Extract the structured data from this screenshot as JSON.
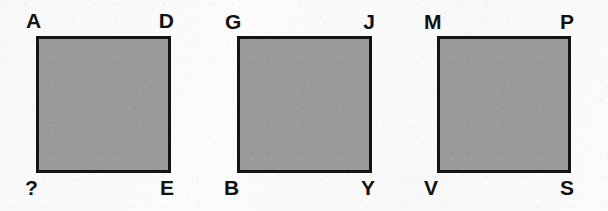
{
  "canvas": {
    "width": 608,
    "height": 211,
    "background_color": "#fbfbfb",
    "fill_color": "#9a9a9a",
    "stroke_color": "#141414",
    "label_color": "#121212"
  },
  "figures": [
    {
      "name": "square-1",
      "x": 36,
      "y": 36,
      "width": 135,
      "height": 137,
      "labels": {
        "top_left": "A",
        "top_right": "D",
        "bottom_left": "?",
        "bottom_right": "E"
      }
    },
    {
      "name": "square-2",
      "x": 237,
      "y": 36,
      "width": 135,
      "height": 137,
      "labels": {
        "top_left": "G",
        "top_right": "J",
        "bottom_left": "B",
        "bottom_right": "Y"
      }
    },
    {
      "name": "square-3",
      "x": 437,
      "y": 36,
      "width": 134,
      "height": 137,
      "labels": {
        "top_left": "M",
        "top_right": "P",
        "bottom_left": "V",
        "bottom_right": "S"
      }
    }
  ]
}
